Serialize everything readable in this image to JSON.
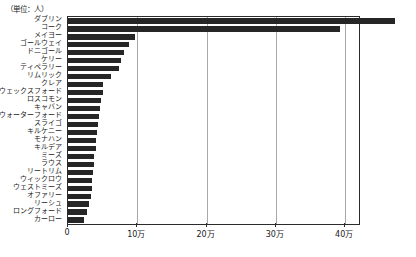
{
  "unit_note": "（単位：人）",
  "chart_data": {
    "type": "bar",
    "orientation": "horizontal",
    "title": "",
    "subtitle": "",
    "xlabel": "",
    "ylabel": "",
    "unit_note": "（単位：人）",
    "grid": true,
    "legend": null,
    "xlim": [
      0,
      420000
    ],
    "xticks": [
      0,
      100000,
      200000,
      300000,
      400000
    ],
    "xtick_labels": [
      "0",
      "10万",
      "20万",
      "30万",
      "40万"
    ],
    "categories": [
      "ダブリン",
      "コーク",
      "メイヨー",
      "ゴールウェイ",
      "ドニゴール",
      "ケリー",
      "ティペラリー",
      "リムリック",
      "クレア",
      "ウェックスフォード",
      "ロスコモン",
      "キャバン",
      "ウォーターフォード",
      "スライゴ",
      "キルケニー",
      "モナハン",
      "キルデア",
      "ミーズ",
      "ラウス",
      "リートリム",
      "ウィックロウ",
      "ウェストミーズ",
      "オファリー",
      "リーシュ",
      "ロングフォード",
      "カーロー"
    ],
    "values": [
      472000,
      392000,
      97000,
      88000,
      81000,
      77000,
      73000,
      62000,
      51000,
      50000,
      48000,
      46000,
      45000,
      43000,
      42000,
      41000,
      40000,
      38000,
      37000,
      36000,
      35000,
      34000,
      33000,
      31000,
      27000,
      23000
    ],
    "bar_color": "#262626"
  }
}
